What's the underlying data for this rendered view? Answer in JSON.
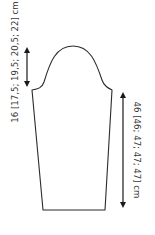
{
  "diagram": {
    "type": "knitting-sleeve-schematic",
    "shape": "sleeve",
    "colors": {
      "outline": "#2b2b2b",
      "arrow": "#1a1a1a",
      "text": "#3a3a3a",
      "background": "#ffffff"
    },
    "measurements": {
      "cap_height": {
        "label": "16 [17,5; 19,5; 20,5; 22] cm",
        "values": [
          "16",
          "17,5",
          "19,5",
          "20,5",
          "22"
        ],
        "unit": "cm",
        "orientation": "vertical-bottom-to-top",
        "position": "left"
      },
      "sleeve_length": {
        "label": "46 [46; 47; 47; 47] cm",
        "values": [
          "46",
          "46",
          "47",
          "47",
          "47"
        ],
        "unit": "cm",
        "orientation": "vertical-top-to-bottom",
        "position": "right"
      }
    }
  }
}
